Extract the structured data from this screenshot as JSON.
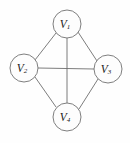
{
  "figure": {
    "background_color": "#fefefe",
    "edge_color": "#6e6e6e",
    "node_fill_color": "#fdfdfd",
    "node_stroke_color": "#707070",
    "label_color": "#1a1a1a"
  },
  "nodes": [
    {
      "id": "v1",
      "base": "V",
      "sub": "1",
      "label": "V1",
      "cx": 67,
      "cy": 24,
      "r": 14
    },
    {
      "id": "v2",
      "base": "V",
      "sub": "2",
      "label": "V2",
      "cx": 24,
      "cy": 68,
      "r": 14
    },
    {
      "id": "v3",
      "base": "V",
      "sub": "3",
      "label": "V3",
      "cx": 108,
      "cy": 69,
      "r": 14
    },
    {
      "id": "v4",
      "base": "V",
      "sub": "4",
      "label": "V4",
      "cx": 67,
      "cy": 117,
      "r": 14
    }
  ],
  "edges": [
    {
      "id": "e-v1-v2",
      "from": "v1",
      "to": "v2",
      "x1": 56,
      "y1": 33,
      "x2": 35,
      "y2": 60
    },
    {
      "id": "e-v1-v3",
      "from": "v1",
      "to": "v3",
      "x1": 78,
      "y1": 32,
      "x2": 97,
      "y2": 61
    },
    {
      "id": "e-v1-v4",
      "from": "v1",
      "to": "v4",
      "x1": 67,
      "y1": 38,
      "x2": 67,
      "y2": 103
    },
    {
      "id": "e-v2-v3",
      "from": "v2",
      "to": "v3",
      "x1": 38,
      "y1": 68,
      "x2": 94,
      "y2": 69
    },
    {
      "id": "e-v2-v4",
      "from": "v2",
      "to": "v4",
      "x1": 35,
      "y1": 77,
      "x2": 56,
      "y2": 107
    },
    {
      "id": "e-v3-v4",
      "from": "v3",
      "to": "v4",
      "x1": 98,
      "y1": 79,
      "x2": 79,
      "y2": 109
    }
  ]
}
